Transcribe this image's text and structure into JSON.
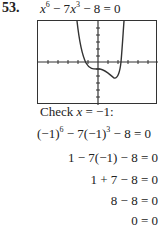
{
  "problem": {
    "number": "53.",
    "equation": {
      "base": "x",
      "exp1": "6",
      "mid": " − 7",
      "base2": "x",
      "exp2": "3",
      "tail": " − 8 = 0"
    }
  },
  "graph": {
    "description": "Calculator graph of y = x^6 - 7x^3 - 8",
    "axis_color": "#333333",
    "curve_color": "#333333"
  },
  "check": {
    "label": "Check ",
    "var": "x",
    "value": " = −1:",
    "steps": [
      {
        "a": "(−1)",
        "e1": "6",
        "b": " − 7(−1)",
        "e2": "3",
        "c": " − 8 = 0"
      },
      {
        "text": "1 − 7(−1) − 8 = 0"
      },
      {
        "text": "1 + 7 − 8 = 0"
      },
      {
        "text": "8 − 8 = 0"
      },
      {
        "text": "0 = 0"
      }
    ]
  }
}
